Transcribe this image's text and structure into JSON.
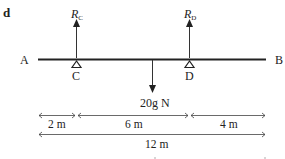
{
  "panel_label": "d",
  "beam": {
    "end_left": "A",
    "end_right": "B",
    "support_left": "C",
    "support_right": "D"
  },
  "forces": {
    "reaction_c": {
      "symbol": "R",
      "subscript": "C"
    },
    "reaction_d": {
      "symbol": "R",
      "subscript": "D"
    },
    "load": "20g N"
  },
  "dimensions": {
    "segments": [
      "2 m",
      "6 m",
      "4 m"
    ],
    "total": "12 m"
  }
}
